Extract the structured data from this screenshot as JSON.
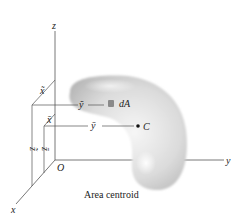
{
  "figure": {
    "caption": "Area centroid",
    "axes": {
      "x_label": "x",
      "y_label": "y",
      "z_label": "z",
      "origin_label": "O"
    },
    "element": {
      "label": "dA",
      "coord_labels": {
        "x": "x̃",
        "y": "ỹ",
        "z": "z̃"
      }
    },
    "centroid": {
      "label": "C",
      "coord_labels": {
        "x": "x̄",
        "y": "ȳ",
        "z": "z̄"
      }
    },
    "colors": {
      "axis_line": "#555555",
      "shape_light": "#f4f4f4",
      "shape_mid": "#d2d2d2",
      "shape_dark": "#b4b4b4",
      "element_patch": "#8a8a8a",
      "centroid_dot": "#111111"
    }
  }
}
